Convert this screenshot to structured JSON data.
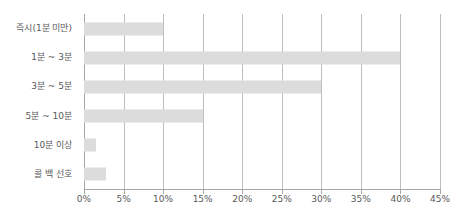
{
  "chart_data": {
    "type": "bar",
    "orientation": "horizontal",
    "title": "",
    "xlabel": "",
    "ylabel": "",
    "categories": [
      "즉시(1분 미만)",
      "1분 ~ 3분",
      "3분 ~ 5분",
      "5분 ~ 10분",
      "10분 이상",
      "콜 백 선호"
    ],
    "values": [
      10,
      40,
      30,
      15,
      1.5,
      2.8
    ],
    "value_unit": "%",
    "xlim": [
      0,
      45
    ],
    "xticks": [
      0,
      5,
      10,
      15,
      20,
      25,
      30,
      35,
      40,
      45
    ],
    "xtick_labels": [
      "0%",
      "5%",
      "10%",
      "15%",
      "20%",
      "25%",
      "30%",
      "35%",
      "40%",
      "45%"
    ],
    "grid": "vertical",
    "legend": "none",
    "series": [
      {
        "name": "",
        "values": [
          10,
          40,
          30,
          15,
          1.5,
          2.8
        ]
      }
    ],
    "colors": {
      "bar": "#dcdcdc",
      "gridline": "#bfbfbf",
      "axis": "#a6a6a6",
      "text": "#595959",
      "background": "#ffffff"
    }
  }
}
